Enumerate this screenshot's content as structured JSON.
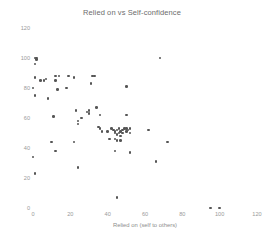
{
  "chart_data": {
    "type": "scatter",
    "title": "Relied on vs Self-confidence",
    "xlabel": "Relied on (self to others)",
    "ylabel": "Self-confidence (none to too much)",
    "xlim": [
      0,
      120
    ],
    "ylim": [
      0,
      120
    ],
    "xticks": [
      0,
      20,
      40,
      60,
      80,
      100,
      120
    ],
    "yticks": [
      0,
      20,
      40,
      60,
      80,
      100,
      120
    ],
    "grid": false,
    "legend": null,
    "marker_color": "#555555",
    "tick_color": "#9a9a9a",
    "series": [
      {
        "name": "respondents",
        "points": [
          [
            1,
            100
          ],
          [
            2,
            100
          ],
          [
            2,
            99
          ],
          [
            1,
            96
          ],
          [
            1,
            87
          ],
          [
            0,
            80
          ],
          [
            1,
            75
          ],
          [
            4,
            85
          ],
          [
            6,
            85
          ],
          [
            7,
            86
          ],
          [
            8,
            73
          ],
          [
            12,
            85
          ],
          [
            12,
            88
          ],
          [
            14,
            88
          ],
          [
            13,
            79
          ],
          [
            11,
            61
          ],
          [
            10,
            44
          ],
          [
            12,
            38
          ],
          [
            0,
            34
          ],
          [
            1,
            23
          ],
          [
            18,
            80
          ],
          [
            19,
            88
          ],
          [
            22,
            87
          ],
          [
            22,
            44
          ],
          [
            23,
            65
          ],
          [
            24,
            56
          ],
          [
            24,
            58
          ],
          [
            24,
            27
          ],
          [
            26,
            60
          ],
          [
            29,
            64
          ],
          [
            30,
            65
          ],
          [
            30,
            63
          ],
          [
            31,
            83
          ],
          [
            32,
            88
          ],
          [
            33,
            88
          ],
          [
            34,
            67
          ],
          [
            36,
            62
          ],
          [
            35,
            54
          ],
          [
            36,
            53
          ],
          [
            37,
            51
          ],
          [
            40,
            51
          ],
          [
            42,
            53
          ],
          [
            43,
            52
          ],
          [
            44,
            51
          ],
          [
            44,
            50
          ],
          [
            45,
            49
          ],
          [
            45,
            52
          ],
          [
            46,
            50
          ],
          [
            46,
            53
          ],
          [
            47,
            51
          ],
          [
            47,
            48
          ],
          [
            48,
            52
          ],
          [
            48,
            50
          ],
          [
            49,
            53
          ],
          [
            50,
            53
          ],
          [
            50,
            51
          ],
          [
            51,
            52
          ],
          [
            52,
            53
          ],
          [
            52,
            50
          ],
          [
            44,
            46
          ],
          [
            45,
            45
          ],
          [
            47,
            45
          ],
          [
            41,
            46
          ],
          [
            44,
            38
          ],
          [
            52,
            37
          ],
          [
            50,
            62
          ],
          [
            50,
            81
          ],
          [
            62,
            52
          ],
          [
            68,
            100
          ],
          [
            66,
            31
          ],
          [
            72,
            44
          ],
          [
            45,
            7
          ],
          [
            95,
            0
          ],
          [
            100,
            0
          ]
        ]
      }
    ]
  }
}
